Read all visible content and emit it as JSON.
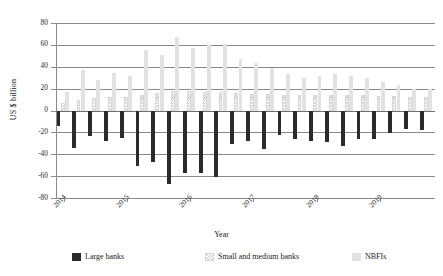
{
  "chart_data": {
    "type": "bar",
    "title": "",
    "xlabel": "Year",
    "ylabel": "US $ billion",
    "ylim": [
      -80,
      80
    ],
    "yticks": [
      80,
      60,
      40,
      20,
      0,
      -20,
      -40,
      -60,
      -80
    ],
    "grid": true,
    "legend_position": "bottom",
    "x_tick_labels": [
      "2014",
      "2015",
      "2016",
      "2017",
      "2018",
      "2019"
    ],
    "categories": [
      "2014Q1",
      "2014Q2",
      "2014Q3",
      "2014Q4",
      "2015Q1",
      "2015Q2",
      "2015Q3",
      "2015Q4",
      "2016Q1",
      "2016Q2",
      "2016Q3",
      "2016Q4",
      "2017Q1",
      "2017Q2",
      "2017Q3",
      "2017Q4",
      "2018Q1",
      "2018Q2",
      "2018Q3",
      "2018Q4",
      "2019Q1",
      "2019Q2",
      "2019Q3",
      "2019Q4"
    ],
    "series": [
      {
        "name": "Large banks",
        "color": "#2b2b2b",
        "values": [
          -14,
          -34,
          -23,
          -28,
          -25,
          -51,
          -47,
          -67,
          -57,
          -57,
          -61,
          -31,
          -28,
          -35,
          -22,
          -26,
          -28,
          -29,
          -32,
          -26,
          -26,
          -21,
          -17,
          -18
        ]
      },
      {
        "name": "Small and medium banks",
        "color": "#ffffff",
        "values": [
          7,
          10,
          11,
          12,
          12,
          14,
          16,
          18,
          18,
          17,
          17,
          16,
          15,
          15,
          14,
          14,
          14,
          14,
          14,
          14,
          13,
          13,
          12,
          12
        ]
      },
      {
        "name": "NBFIs",
        "color": "#e2e2e2",
        "values": [
          17,
          37,
          28,
          34,
          32,
          55,
          51,
          67,
          57,
          60,
          61,
          47,
          43,
          39,
          33,
          30,
          32,
          33,
          32,
          30,
          26,
          23,
          20,
          20
        ]
      }
    ]
  },
  "legend": {
    "items": [
      {
        "label": "Large banks",
        "swatch": "large"
      },
      {
        "label": "Small and medium banks",
        "swatch": "smb"
      },
      {
        "label": "NBFIs",
        "swatch": "nbfi"
      }
    ]
  }
}
